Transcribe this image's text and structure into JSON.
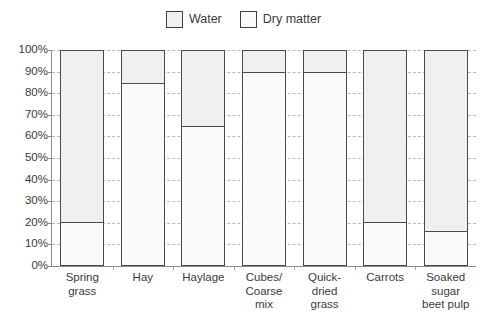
{
  "legend": {
    "items": [
      {
        "label": "Water",
        "color": "#f0f0f0"
      },
      {
        "label": "Dry matter",
        "color": "#fafafa"
      }
    ]
  },
  "axis": {
    "y_ticks": [
      "0%",
      "10%",
      "20%",
      "30%",
      "40%",
      "50%",
      "60%",
      "70%",
      "80%",
      "90%",
      "100%"
    ]
  },
  "chart_data": {
    "type": "bar",
    "subtype": "stacked-100-percent",
    "title": "",
    "subtitle": "",
    "xlabel": "",
    "ylabel": "",
    "ylim": [
      0,
      100
    ],
    "ytick_step": 10,
    "ytick_format": "percent",
    "grid": true,
    "grid_style": "dashed-horizontal",
    "legend_position": "top-center",
    "categories": [
      "Spring grass",
      "Hay",
      "Haylage",
      "Cubes/ Coarse mix",
      "Quick-dried grass",
      "Carrots",
      "Soaked sugar beet pulp"
    ],
    "category_label_lines": [
      [
        "Spring",
        "grass"
      ],
      [
        "Hay"
      ],
      [
        "Haylage"
      ],
      [
        "Cubes/",
        "Coarse",
        "mix"
      ],
      [
        "Quick-",
        "dried",
        "grass"
      ],
      [
        "Carrots"
      ],
      [
        "Soaked",
        "sugar",
        "beet pulp"
      ]
    ],
    "series": [
      {
        "name": "Dry matter",
        "color": "#fafafa",
        "values": [
          20,
          85,
          65,
          90,
          90,
          20,
          16
        ]
      },
      {
        "name": "Water",
        "color": "#f0f0f0",
        "values": [
          80,
          15,
          35,
          10,
          10,
          80,
          84
        ]
      }
    ],
    "annotations": []
  }
}
